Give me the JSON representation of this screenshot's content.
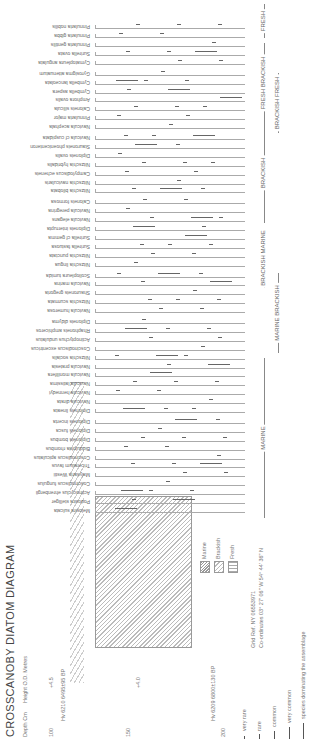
{
  "title": "CROSSCANOBY DIATOM DIAGRAM",
  "depth_axis": {
    "label": "Depth Cm",
    "ticks": [
      "100",
      "150",
      "200"
    ]
  },
  "height_axis": {
    "label": "Height O.D. Metres",
    "ticks": [
      "+4.5",
      "+4.0"
    ]
  },
  "dates": [
    {
      "lab": "Hv 6210",
      "age": "6495±95 BP",
      "depth": "100"
    },
    {
      "lab": "Hv 6209",
      "age": "6800±130 BP",
      "depth": "200"
    }
  ],
  "lithology_legend": [
    {
      "label": "Marine"
    },
    {
      "label": "Brackish"
    },
    {
      "label": "Fresh"
    }
  ],
  "site": {
    "grid_ref": "Grid Ref. NY 06553971",
    "coordinates": "Co-ordinates 03° 27' 06\" W 54° 44' 36\" N"
  },
  "frequency_legend": [
    {
      "label": "very rare"
    },
    {
      "label": "rare"
    },
    {
      "label": "common"
    },
    {
      "label": "very common"
    },
    {
      "label": "species dominating the assemblage"
    }
  ],
  "chart_data": {
    "type": "table",
    "title": "CROSSCANOBY DIATOM DIAGRAM",
    "xlabel": "Diatom species grouped by salinity preference",
    "ylabel": "Depth (cm) / Height O.D. (m)",
    "depth_range_cm": [
      95,
      205
    ],
    "groups": [
      {
        "name": "MARINE",
        "species": [
          "Melosira sulcata",
          "Podosira stelliger",
          "Actinocyclus ehrenbergii",
          "Coscinodiscus fungulus",
          "Malysaria Westii",
          "Triceratium favus",
          "Coscinodiscus apiculatus",
          "Biddulphia rhombus",
          "Diploneis bombus",
          "Diploneis fusca",
          "Diploneis incerta"
        ]
      },
      {
        "name": "MARINE BRACKISH",
        "species": [
          "Diploneis lineata",
          "Navicula dirata",
          "Navicula hennedyi",
          "Navicula latissima",
          "Navicula monilifera",
          "Navicula pratesia",
          "Nitzschia socialis",
          "Coscinodiscus excentricus",
          "Actinoptychus undulatus",
          "Rhaphoneis amphiceros",
          "Diploneis didyma"
        ]
      },
      {
        "name": "BRACKISH MARINE",
        "species": [
          "Navicula humerosa",
          "Nitzschia scurmata",
          "Shauroneis gregoria",
          "Navicula marina",
          "Scoliopleura tumida"
        ]
      },
      {
        "name": "BRACKISH",
        "species": [
          "Nitzschia lingua",
          "Nitzschia punctata",
          "Surirella fastuosa",
          "Surirella cf gemma",
          "Diploneis interrupta",
          "Navicula elegans",
          "Navicula peregrina",
          "Caloneis formosa"
        ]
      },
      {
        "name": "BRACKISH FRESH",
        "species": [
          "Nitzschia bilobata",
          "Nitzschia navicularis",
          "Campylodiscus echeneis",
          "Nitzschia hybridalis",
          "Diploneis ovalis",
          "Stauroneis phoenicenteron",
          "Navicula cf cuspidata"
        ]
      },
      {
        "name": "FRESH BRACKISH",
        "species": [
          "Navicula acephala",
          "Pinnularia major",
          "Caloneis silicula",
          "Amphora ovalis",
          "Cymbella aspera",
          "Cymbella lanceolata",
          "Gyrosigma attenuatum"
        ]
      },
      {
        "name": "FRESH",
        "species": [
          "Cymatopleura angulata",
          "Surirella ovata",
          "Pinnularia gentilis",
          "Pinnularia gibba",
          "Pinnularia nobilis"
        ]
      }
    ],
    "lithology_units": [
      {
        "name": "Marine",
        "position": "lower"
      },
      {
        "name": "Brackish",
        "position": "middle"
      },
      {
        "name": "Fresh",
        "position": "upper"
      }
    ],
    "frequency_classes": [
      "very rare",
      "rare",
      "common",
      "very common",
      "dominant"
    ]
  }
}
